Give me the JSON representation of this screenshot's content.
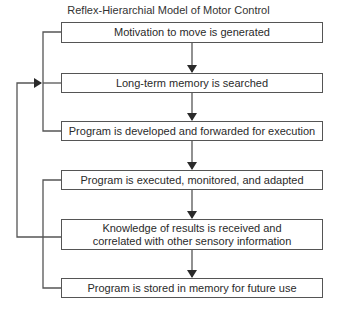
{
  "diagram": {
    "title": "Reflex-Hierarchial Model of Motor Control",
    "boxes": [
      {
        "id": "motivation",
        "label": "Motivation to move is generated"
      },
      {
        "id": "memory-search",
        "label": "Long-term memory is searched"
      },
      {
        "id": "program-developed",
        "label": "Program is developed and forwarded for execution"
      },
      {
        "id": "program-executed",
        "label": "Program is executed, monitored, and adapted"
      },
      {
        "id": "knowledge-results",
        "label": "Knowledge of results is received and correlated with other sensory information"
      },
      {
        "id": "program-stored",
        "label": "Program is stored in memory for future use"
      }
    ],
    "edges": [
      {
        "from": "motivation",
        "to": "memory-search",
        "type": "arrow-down"
      },
      {
        "from": "memory-search",
        "to": "program-developed",
        "type": "arrow-down"
      },
      {
        "from": "program-developed",
        "to": "program-executed",
        "type": "arrow-down"
      },
      {
        "from": "program-executed",
        "to": "knowledge-results",
        "type": "arrow-down"
      },
      {
        "from": "knowledge-results",
        "to": "program-stored",
        "type": "arrow-down"
      },
      {
        "from": "knowledge-results",
        "to": "memory-search",
        "type": "feedback-loop-left"
      }
    ],
    "colors": {
      "line": "#555555",
      "text": "#2a2a2a",
      "background": "#ffffff"
    }
  }
}
